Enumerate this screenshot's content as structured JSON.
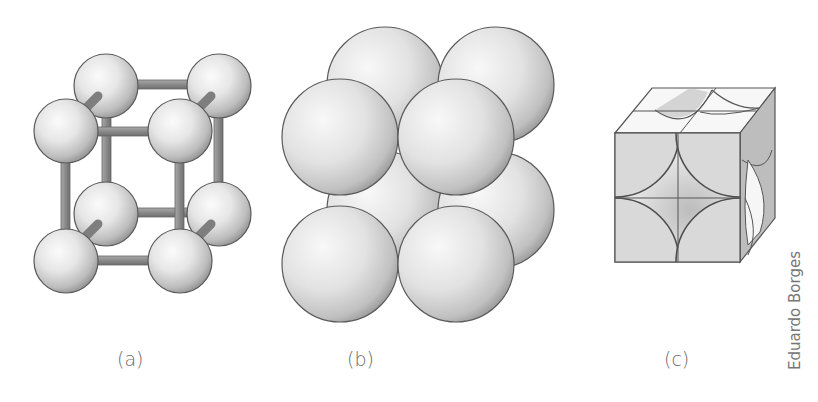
{
  "figure": {
    "panels": [
      {
        "id": "a",
        "label": "(a)",
        "description": "Ball-and-stick model of simple cubic unit cell"
      },
      {
        "id": "b",
        "label": "(b)",
        "description": "Space-filling model of simple cubic unit cell"
      },
      {
        "id": "c",
        "label": "(c)",
        "description": "Unit cell cube showing sphere sections at corners"
      }
    ],
    "credit": "Eduardo Borges",
    "colors": {
      "sphere_light": "#f4f4f4",
      "sphere_dark": "#9a9a9a",
      "outline": "#5a5a5a",
      "rod": "#8e8e8e",
      "face": "#d9d9d9",
      "side_face": "#a8a8a8",
      "label": "#6a6a6a"
    }
  }
}
